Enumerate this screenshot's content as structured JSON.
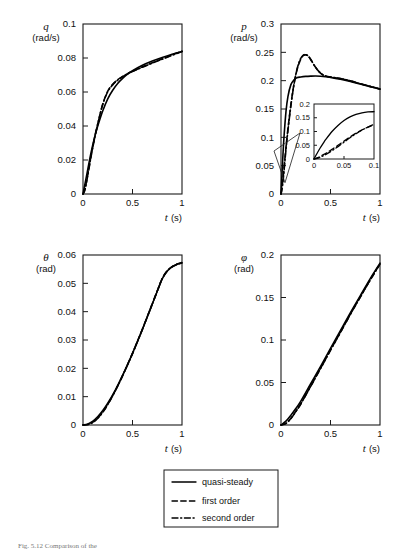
{
  "figure": {
    "caption": "Fig. 5.12  Comparison of the"
  },
  "legend": {
    "items": [
      {
        "label": "quasi-steady",
        "style": "solid"
      },
      {
        "label": "first order",
        "style": "dashed"
      },
      {
        "label": "second order",
        "style": "dash-dot"
      }
    ]
  },
  "chart_data": [
    {
      "type": "line",
      "id": "q-plot",
      "title": "",
      "ylabel": "q",
      "yunit": "(rad/s)",
      "xlabel": "t (s)",
      "xlim": [
        0,
        1
      ],
      "ylim": [
        0,
        0.1
      ],
      "xticks": [
        0,
        0.5,
        1
      ],
      "xticklabels": [
        "0",
        "0.5",
        "1"
      ],
      "yticks": [
        0,
        0.02,
        0.04,
        0.06,
        0.08,
        0.1
      ],
      "yticklabels": [
        "0",
        "0.02",
        "0.04",
        "0.06",
        "0.08",
        "0.1"
      ],
      "grid": false,
      "series": [
        {
          "name": "quasi-steady",
          "style": "solid",
          "x": [
            0,
            0.02,
            0.05,
            0.08,
            0.12,
            0.16,
            0.2,
            0.25,
            0.3,
            0.35,
            0.4,
            0.45,
            0.5,
            0.6,
            0.7,
            0.8,
            0.9,
            1.0
          ],
          "y": [
            0,
            0.006,
            0.015,
            0.024,
            0.034,
            0.042,
            0.049,
            0.056,
            0.061,
            0.065,
            0.068,
            0.0705,
            0.0725,
            0.0757,
            0.0782,
            0.0803,
            0.0822,
            0.0838
          ]
        },
        {
          "name": "first order",
          "style": "dashed",
          "x": [
            0,
            0.02,
            0.05,
            0.08,
            0.12,
            0.16,
            0.2,
            0.25,
            0.3,
            0.35,
            0.4,
            0.45,
            0.5,
            0.6,
            0.7,
            0.8,
            0.9,
            1.0
          ],
          "y": [
            0,
            0.003,
            0.012,
            0.022,
            0.034,
            0.044,
            0.053,
            0.0605,
            0.0645,
            0.0672,
            0.0692,
            0.0708,
            0.0722,
            0.0748,
            0.0772,
            0.0795,
            0.0818,
            0.084
          ]
        },
        {
          "name": "second order",
          "style": "dash-dot",
          "x": [
            0,
            0.02,
            0.05,
            0.08,
            0.12,
            0.16,
            0.2,
            0.25,
            0.3,
            0.35,
            0.4,
            0.45,
            0.5,
            0.6,
            0.7,
            0.8,
            0.9,
            1.0
          ],
          "y": [
            0,
            0.0025,
            0.0115,
            0.0215,
            0.0335,
            0.0438,
            0.0528,
            0.0602,
            0.0642,
            0.067,
            0.069,
            0.0706,
            0.072,
            0.0746,
            0.077,
            0.0793,
            0.0816,
            0.0838
          ]
        }
      ]
    },
    {
      "type": "line",
      "id": "p-plot",
      "title": "",
      "ylabel": "p",
      "yunit": "(rad/s)",
      "xlabel": "t (s)",
      "xlim": [
        0,
        1
      ],
      "ylim": [
        0,
        0.3
      ],
      "xticks": [
        0,
        0.5,
        1
      ],
      "xticklabels": [
        "0",
        "0.5",
        "1"
      ],
      "yticks": [
        0,
        0.05,
        0.1,
        0.15,
        0.2,
        0.25,
        0.3
      ],
      "yticklabels": [
        "0",
        "0.05",
        "0.1",
        "0.15",
        "0.2",
        "0.25",
        "0.3"
      ],
      "grid": false,
      "series": [
        {
          "name": "quasi-steady",
          "style": "solid",
          "x": [
            0,
            0.01,
            0.02,
            0.03,
            0.05,
            0.07,
            0.1,
            0.13,
            0.16,
            0.2,
            0.25,
            0.3,
            0.35,
            0.4,
            0.45,
            0.5,
            0.6,
            0.7,
            0.8,
            0.9,
            1.0
          ],
          "y": [
            0,
            0.035,
            0.07,
            0.1,
            0.145,
            0.172,
            0.193,
            0.201,
            0.205,
            0.2065,
            0.2075,
            0.208,
            0.2082,
            0.2078,
            0.207,
            0.2058,
            0.2025,
            0.1985,
            0.194,
            0.1895,
            0.185
          ]
        },
        {
          "name": "first order",
          "style": "dashed",
          "x": [
            0,
            0.01,
            0.02,
            0.03,
            0.05,
            0.07,
            0.1,
            0.13,
            0.16,
            0.19,
            0.22,
            0.25,
            0.28,
            0.31,
            0.34,
            0.38,
            0.42,
            0.46,
            0.5,
            0.6,
            0.7,
            0.8,
            0.9,
            1.0
          ],
          "y": [
            0,
            0.012,
            0.028,
            0.045,
            0.082,
            0.115,
            0.158,
            0.193,
            0.218,
            0.234,
            0.2435,
            0.2455,
            0.242,
            0.2345,
            0.2258,
            0.2165,
            0.2105,
            0.2075,
            0.2062,
            0.2035,
            0.1995,
            0.1945,
            0.1898,
            0.1852
          ]
        },
        {
          "name": "second order",
          "style": "dash-dot",
          "x": [
            0,
            0.01,
            0.02,
            0.03,
            0.05,
            0.07,
            0.1,
            0.13,
            0.16,
            0.19,
            0.22,
            0.25,
            0.28,
            0.31,
            0.34,
            0.38,
            0.42,
            0.46,
            0.5,
            0.6,
            0.7,
            0.8,
            0.9,
            1.0
          ],
          "y": [
            0,
            0.008,
            0.022,
            0.04,
            0.078,
            0.112,
            0.156,
            0.192,
            0.219,
            0.236,
            0.2445,
            0.2462,
            0.2425,
            0.2348,
            0.226,
            0.2168,
            0.2108,
            0.2078,
            0.2064,
            0.2037,
            0.1997,
            0.1947,
            0.19,
            0.1854
          ]
        }
      ],
      "inset": {
        "xlim": [
          0,
          0.1
        ],
        "ylim": [
          0,
          0.2
        ],
        "xticks": [
          0,
          0.05,
          0.1
        ],
        "xticklabels": [
          "0",
          "0.05",
          "0.1"
        ],
        "yticks": [
          0,
          0.05,
          0.1,
          0.15,
          0.2
        ],
        "yticklabels": [
          "0",
          "0.05",
          "0.1",
          "0.15",
          "0.2"
        ],
        "series": [
          {
            "name": "quasi-steady",
            "style": "solid",
            "x": [
              0,
              0.005,
              0.01,
              0.015,
              0.02,
              0.03,
              0.04,
              0.05,
              0.06,
              0.07,
              0.08,
              0.09,
              0.1
            ],
            "y": [
              0,
              0.02,
              0.039,
              0.056,
              0.072,
              0.1,
              0.122,
              0.14,
              0.153,
              0.162,
              0.168,
              0.171,
              0.172
            ]
          },
          {
            "name": "first order",
            "style": "dashed",
            "x": [
              0,
              0.005,
              0.01,
              0.015,
              0.02,
              0.03,
              0.04,
              0.05,
              0.06,
              0.07,
              0.08,
              0.09,
              0.1
            ],
            "y": [
              0,
              0.004,
              0.009,
              0.015,
              0.021,
              0.035,
              0.05,
              0.065,
              0.08,
              0.094,
              0.106,
              0.116,
              0.124
            ]
          },
          {
            "name": "second order",
            "style": "dash-dot",
            "x": [
              0,
              0.005,
              0.01,
              0.015,
              0.02,
              0.03,
              0.04,
              0.05,
              0.06,
              0.07,
              0.08,
              0.09,
              0.1
            ],
            "y": [
              0,
              0.002,
              0.006,
              0.011,
              0.017,
              0.03,
              0.045,
              0.061,
              0.077,
              0.092,
              0.105,
              0.116,
              0.126
            ]
          }
        ]
      }
    },
    {
      "type": "line",
      "id": "theta-plot",
      "title": "",
      "ylabel": "θ",
      "yunit": "(rad)",
      "xlabel": "t (s)",
      "xlim": [
        0,
        1
      ],
      "ylim": [
        0,
        0.06
      ],
      "xticks": [
        0,
        0.5,
        1
      ],
      "xticklabels": [
        "0",
        "0.5",
        "1"
      ],
      "yticks": [
        0,
        0.01,
        0.02,
        0.03,
        0.04,
        0.05,
        0.06
      ],
      "yticklabels": [
        "0",
        "0.01",
        "0.02",
        "0.03",
        "0.04",
        "0.05",
        "0.06"
      ],
      "grid": false,
      "series": [
        {
          "name": "quasi-steady",
          "style": "solid",
          "x": [
            0,
            0.05,
            0.1,
            0.15,
            0.2,
            0.25,
            0.3,
            0.35,
            0.4,
            0.45,
            0.5,
            0.55,
            0.6,
            0.65,
            0.7,
            0.75,
            0.8,
            0.85,
            0.9,
            0.95,
            1.0
          ],
          "y": [
            0,
            0.0004,
            0.0014,
            0.003,
            0.0051,
            0.0077,
            0.0106,
            0.0139,
            0.0175,
            0.0213,
            0.0253,
            0.0295,
            0.0338,
            0.0382,
            0.0427,
            0.0472,
            0.0516,
            0.0543,
            0.0558,
            0.0567,
            0.0572
          ]
        },
        {
          "name": "first order",
          "style": "dashed",
          "x": [
            0,
            0.05,
            0.1,
            0.15,
            0.2,
            0.25,
            0.3,
            0.35,
            0.4,
            0.45,
            0.5,
            0.55,
            0.6,
            0.65,
            0.7,
            0.75,
            0.8,
            0.85,
            0.9,
            0.95,
            1.0
          ],
          "y": [
            0,
            0.0002,
            0.001,
            0.0025,
            0.0046,
            0.0073,
            0.0104,
            0.0138,
            0.0174,
            0.0213,
            0.0253,
            0.0295,
            0.0338,
            0.0383,
            0.0428,
            0.0473,
            0.0517,
            0.0544,
            0.0559,
            0.0568,
            0.0574
          ]
        },
        {
          "name": "second order",
          "style": "dash-dot",
          "x": [
            0,
            0.05,
            0.1,
            0.15,
            0.2,
            0.25,
            0.3,
            0.35,
            0.4,
            0.45,
            0.5,
            0.55,
            0.6,
            0.65,
            0.7,
            0.75,
            0.8,
            0.85,
            0.9,
            0.95,
            1.0
          ],
          "y": [
            0,
            0.00015,
            0.0009,
            0.0024,
            0.0045,
            0.0072,
            0.0103,
            0.0137,
            0.0174,
            0.0212,
            0.0252,
            0.0294,
            0.0337,
            0.0382,
            0.0427,
            0.0472,
            0.0516,
            0.0543,
            0.0558,
            0.0567,
            0.0572
          ]
        }
      ]
    },
    {
      "type": "line",
      "id": "phi-plot",
      "title": "",
      "ylabel": "φ",
      "yunit": "(rad)",
      "xlabel": "t (s)",
      "xlim": [
        0,
        1
      ],
      "ylim": [
        0,
        0.2
      ],
      "xticks": [
        0,
        0.5,
        1
      ],
      "xticklabels": [
        "0",
        "0.5",
        "1"
      ],
      "yticks": [
        0,
        0.05,
        0.1,
        0.15,
        0.2
      ],
      "yticklabels": [
        "0",
        "0.05",
        "0.1",
        "0.15",
        "0.2"
      ],
      "grid": false,
      "series": [
        {
          "name": "quasi-steady",
          "style": "solid",
          "x": [
            0,
            0.05,
            0.1,
            0.15,
            0.2,
            0.3,
            0.4,
            0.5,
            0.6,
            0.7,
            0.8,
            0.9,
            1.0
          ],
          "y": [
            0,
            0.0045,
            0.0115,
            0.0195,
            0.028,
            0.0485,
            0.069,
            0.0902,
            0.111,
            0.132,
            0.152,
            0.172,
            0.1905
          ]
        },
        {
          "name": "first order",
          "style": "dashed",
          "x": [
            0,
            0.05,
            0.1,
            0.15,
            0.2,
            0.3,
            0.4,
            0.5,
            0.6,
            0.7,
            0.8,
            0.9,
            1.0
          ],
          "y": [
            0,
            0.002,
            0.008,
            0.0162,
            0.025,
            0.0458,
            0.0668,
            0.0882,
            0.109,
            0.1302,
            0.1505,
            0.1705,
            0.1895
          ]
        },
        {
          "name": "second order",
          "style": "dash-dot",
          "x": [
            0,
            0.05,
            0.1,
            0.15,
            0.2,
            0.3,
            0.4,
            0.5,
            0.6,
            0.7,
            0.8,
            0.9,
            1.0
          ],
          "y": [
            0,
            0.0018,
            0.0075,
            0.0158,
            0.0247,
            0.0455,
            0.0665,
            0.088,
            0.1088,
            0.13,
            0.1503,
            0.1703,
            0.1893
          ]
        }
      ]
    }
  ]
}
